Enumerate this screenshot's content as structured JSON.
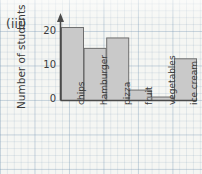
{
  "figure": {
    "part_label": "(iii)",
    "paper": "graph-paper"
  },
  "chart_data": {
    "type": "bar",
    "title": "",
    "xlabel": "",
    "ylabel": "Number of students",
    "categories": [
      "chips",
      "hamburger",
      "pizza",
      "fruit",
      "vegetables",
      "ice cream"
    ],
    "values": [
      21,
      15,
      18,
      3,
      1,
      12
    ],
    "ylim": [
      0,
      22
    ],
    "yticks": [
      0,
      10,
      20
    ],
    "ytick_labels": [
      "0",
      "10",
      "20"
    ],
    "grid": true,
    "legend": null,
    "bar_fill": "#c9c9c9",
    "bar_stroke": "#6e6e6e",
    "axis_color": "#4a4a4a",
    "axis_arrow": "up"
  }
}
